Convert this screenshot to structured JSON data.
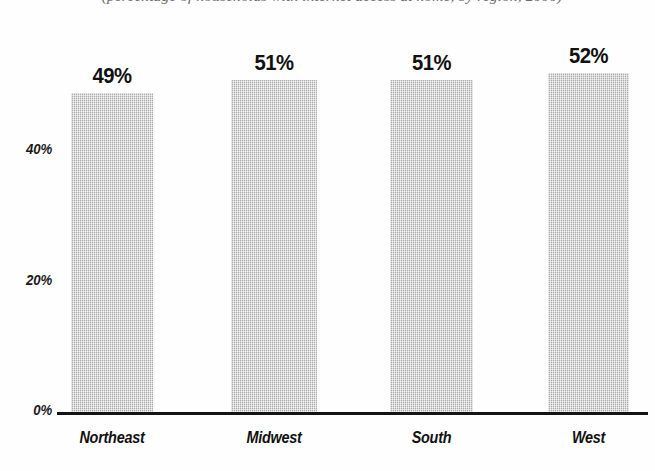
{
  "chart_data": {
    "type": "bar",
    "title": "(percentage of households with internet access at home, by region, 2000)",
    "categories": [
      "Northeast",
      "Midwest",
      "South",
      "West"
    ],
    "values": [
      49,
      51,
      51,
      52
    ],
    "data_labels": [
      "49%",
      "51%",
      "51%",
      "52%"
    ],
    "xlabel": "",
    "ylabel": "",
    "ylim": [
      0,
      56
    ],
    "yticks": [
      0,
      20,
      40
    ],
    "ytick_labels": [
      "0%",
      "20%",
      "40%"
    ],
    "grid": false,
    "legend": false,
    "bar_color": "#c6c6c6",
    "axis_color": "#141414",
    "text_color": "#111111"
  }
}
